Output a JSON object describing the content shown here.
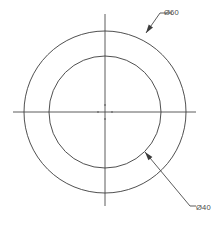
{
  "drawing": {
    "type": "engineering-drawing",
    "description": "Front view of an annular disc (washer / ring) shown with two concentric circles and crossing centre lines",
    "canvas": {
      "width": 221,
      "height": 225,
      "background": "#ffffff"
    },
    "line_color": "#3c3c3c",
    "centerline_color": "#4a4a4a",
    "text_color": "#4a4a4a",
    "center": {
      "x": 105,
      "y": 112
    },
    "circles": [
      {
        "name": "outer-circle",
        "label": "Ø60",
        "radius_px": 81,
        "diameter_value": 60,
        "symbol": "Ø"
      },
      {
        "name": "inner-circle",
        "label": "Ø40",
        "radius_px": 56,
        "diameter_value": 40,
        "symbol": "Ø"
      }
    ],
    "center_lines": {
      "horizontal": {
        "x1": 13,
        "x2": 196,
        "y": 112
      },
      "vertical": {
        "y1": 14,
        "y2": 206,
        "x": 105
      }
    },
    "dimensions": [
      {
        "name": "outer-diameter-callout",
        "text": "Ø60",
        "text_x": 164,
        "text_y": 15,
        "arrow_x": 146,
        "arrow_y": 33,
        "elbow_x": 160,
        "elbow_y": 13,
        "shelf_x": 172,
        "refers_to": "outer-circle"
      },
      {
        "name": "inner-diameter-callout",
        "text": "Ø40",
        "text_x": 196,
        "text_y": 210,
        "arrow_x": 145,
        "arrow_y": 152,
        "elbow_x": 190,
        "elbow_y": 206,
        "shelf_x": 196,
        "refers_to": "inner-circle"
      }
    ]
  }
}
